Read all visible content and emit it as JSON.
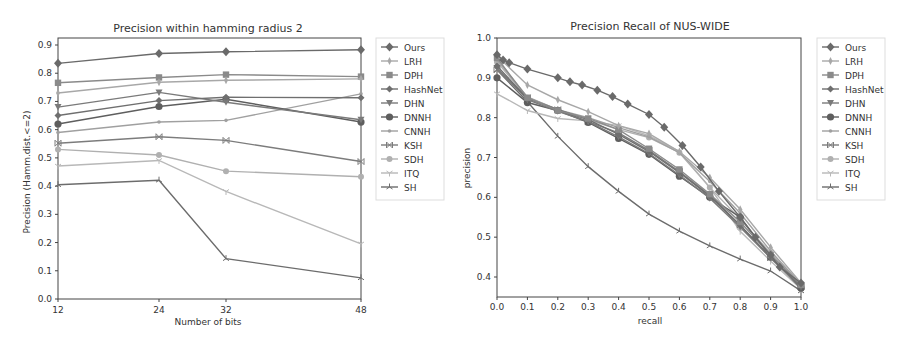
{
  "chart_data": [
    {
      "type": "line",
      "title": "Precision within hamming radius 2",
      "xlabel": "Number of bits",
      "ylabel": "Precision (Hamm.dist.<=2)",
      "x": [
        12,
        24,
        32,
        48
      ],
      "x_tick_labels": [
        "12",
        "24",
        "32",
        "48"
      ],
      "x_scale": "categorical-positions",
      "ylim": [
        0.0,
        0.92
      ],
      "y_ticks": [
        0.0,
        0.1,
        0.2,
        0.3,
        0.4,
        0.5,
        0.6,
        0.7,
        0.8,
        0.9
      ],
      "y_tick_labels": [
        "0.0",
        "0.1",
        "0.2",
        "0.3",
        "0.4",
        "0.5",
        "0.6",
        "0.7",
        "0.8",
        "0.9"
      ],
      "grid": false,
      "legend_position": "outside-right",
      "series": [
        {
          "name": "Ours",
          "marker": "diamond-big",
          "values": [
            0.835,
            0.87,
            0.876,
            0.883
          ]
        },
        {
          "name": "LRH",
          "marker": "thin-diamond",
          "values": [
            0.73,
            0.768,
            0.775,
            0.78
          ]
        },
        {
          "name": "DPH",
          "marker": "square",
          "values": [
            0.766,
            0.785,
            0.795,
            0.788
          ]
        },
        {
          "name": "HashNet",
          "marker": "plus-diamond",
          "values": [
            0.65,
            0.703,
            0.715,
            0.713
          ]
        },
        {
          "name": "DHN",
          "marker": "triangle-down",
          "values": [
            0.68,
            0.732,
            0.697,
            0.635
          ]
        },
        {
          "name": "DNNH",
          "marker": "circle",
          "values": [
            0.62,
            0.682,
            0.708,
            0.627
          ]
        },
        {
          "name": "CNNH",
          "marker": "star",
          "values": [
            0.59,
            0.627,
            0.633,
            0.727
          ]
        },
        {
          "name": "KSH",
          "marker": "x-bar",
          "values": [
            0.552,
            0.575,
            0.562,
            0.487
          ]
        },
        {
          "name": "SDH",
          "marker": "small-circle",
          "values": [
            0.53,
            0.51,
            0.453,
            0.433
          ]
        },
        {
          "name": "ITQ",
          "marker": "tri-down",
          "values": [
            0.471,
            0.491,
            0.381,
            0.195
          ]
        },
        {
          "name": "SH",
          "marker": "tri-up",
          "values": [
            0.405,
            0.421,
            0.143,
            0.075
          ]
        }
      ]
    },
    {
      "type": "line",
      "title": "Precision Recall of NUS-WIDE",
      "xlabel": "recall",
      "ylabel": "precision",
      "xlim": [
        0.0,
        1.0
      ],
      "ylim": [
        0.35,
        1.0
      ],
      "x_ticks": [
        0.0,
        0.1,
        0.2,
        0.3,
        0.4,
        0.5,
        0.6,
        0.7,
        0.8,
        0.9,
        1.0
      ],
      "x_tick_labels": [
        "0.0",
        "0.1",
        "0.2",
        "0.3",
        "0.4",
        "0.5",
        "0.6",
        "0.7",
        "0.8",
        "0.9",
        "1.0"
      ],
      "y_ticks": [
        0.4,
        0.5,
        0.6,
        0.7,
        0.8,
        0.9,
        1.0
      ],
      "y_tick_labels": [
        "0.4",
        "0.5",
        "0.6",
        "0.7",
        "0.8",
        "0.9",
        "1.0"
      ],
      "grid": false,
      "legend_position": "outside-right",
      "series": [
        {
          "name": "Ours",
          "marker": "diamond-big",
          "points": [
            [
              0.0,
              0.958
            ],
            [
              0.02,
              0.945
            ],
            [
              0.04,
              0.938
            ],
            [
              0.1,
              0.922
            ],
            [
              0.2,
              0.9
            ],
            [
              0.24,
              0.89
            ],
            [
              0.28,
              0.882
            ],
            [
              0.33,
              0.869
            ],
            [
              0.38,
              0.853
            ],
            [
              0.43,
              0.834
            ],
            [
              0.5,
              0.808
            ],
            [
              0.55,
              0.776
            ],
            [
              0.61,
              0.73
            ],
            [
              0.67,
              0.676
            ],
            [
              0.73,
              0.615
            ],
            [
              0.8,
              0.55
            ],
            [
              0.85,
              0.5
            ],
            [
              0.9,
              0.455
            ],
            [
              0.93,
              0.425
            ],
            [
              1.0,
              0.385
            ]
          ]
        },
        {
          "name": "LRH",
          "marker": "thin-diamond",
          "points": [
            [
              0.0,
              0.955
            ],
            [
              0.1,
              0.882
            ],
            [
              0.2,
              0.845
            ],
            [
              0.3,
              0.815
            ],
            [
              0.4,
              0.78
            ],
            [
              0.5,
              0.76
            ],
            [
              0.6,
              0.715
            ],
            [
              0.7,
              0.65
            ],
            [
              0.8,
              0.57
            ],
            [
              0.9,
              0.475
            ],
            [
              1.0,
              0.385
            ]
          ]
        },
        {
          "name": "DPH",
          "marker": "square",
          "points": [
            [
              0.0,
              0.95
            ],
            [
              0.1,
              0.85
            ],
            [
              0.2,
              0.818
            ],
            [
              0.3,
              0.798
            ],
            [
              0.4,
              0.77
            ],
            [
              0.5,
              0.722
            ],
            [
              0.6,
              0.67
            ],
            [
              0.7,
              0.608
            ],
            [
              0.8,
              0.538
            ],
            [
              0.9,
              0.455
            ],
            [
              1.0,
              0.38
            ]
          ]
        },
        {
          "name": "HashNet",
          "marker": "plus-diamond",
          "points": [
            [
              0.0,
              0.93
            ],
            [
              0.1,
              0.848
            ],
            [
              0.2,
              0.82
            ],
            [
              0.3,
              0.795
            ],
            [
              0.4,
              0.758
            ],
            [
              0.5,
              0.715
            ],
            [
              0.6,
              0.662
            ],
            [
              0.7,
              0.603
            ],
            [
              0.8,
              0.53
            ],
            [
              0.9,
              0.45
            ],
            [
              1.0,
              0.378
            ]
          ]
        },
        {
          "name": "DHN",
          "marker": "triangle-down",
          "points": [
            [
              0.0,
              0.925
            ],
            [
              0.1,
              0.845
            ],
            [
              0.2,
              0.816
            ],
            [
              0.3,
              0.79
            ],
            [
              0.4,
              0.752
            ],
            [
              0.5,
              0.71
            ],
            [
              0.6,
              0.656
            ],
            [
              0.7,
              0.598
            ],
            [
              0.8,
              0.525
            ],
            [
              0.9,
              0.448
            ],
            [
              1.0,
              0.375
            ]
          ]
        },
        {
          "name": "DNNH",
          "marker": "circle",
          "points": [
            [
              0.0,
              0.9
            ],
            [
              0.1,
              0.838
            ],
            [
              0.2,
              0.818
            ],
            [
              0.3,
              0.788
            ],
            [
              0.4,
              0.748
            ],
            [
              0.5,
              0.708
            ],
            [
              0.6,
              0.653
            ],
            [
              0.7,
              0.6
            ],
            [
              0.8,
              0.55
            ],
            [
              0.9,
              0.45
            ],
            [
              1.0,
              0.372
            ]
          ]
        },
        {
          "name": "CNNH",
          "marker": "star",
          "points": [
            [
              0.0,
              0.945
            ],
            [
              0.1,
              0.852
            ],
            [
              0.2,
              0.82
            ],
            [
              0.3,
              0.8
            ],
            [
              0.4,
              0.775
            ],
            [
              0.5,
              0.752
            ],
            [
              0.6,
              0.712
            ],
            [
              0.7,
              0.64
            ],
            [
              0.8,
              0.56
            ],
            [
              0.9,
              0.465
            ],
            [
              1.0,
              0.382
            ]
          ]
        },
        {
          "name": "KSH",
          "marker": "x-bar",
          "points": [
            [
              0.0,
              0.92
            ],
            [
              0.1,
              0.85
            ],
            [
              0.2,
              0.82
            ],
            [
              0.3,
              0.79
            ],
            [
              0.4,
              0.762
            ],
            [
              0.5,
              0.718
            ],
            [
              0.6,
              0.665
            ],
            [
              0.7,
              0.605
            ],
            [
              0.8,
              0.53
            ],
            [
              0.9,
              0.448
            ],
            [
              1.0,
              0.375
            ]
          ]
        },
        {
          "name": "SDH",
          "marker": "small-circle",
          "points": [
            [
              0.0,
              0.94
            ],
            [
              0.1,
              0.85
            ],
            [
              0.2,
              0.82
            ],
            [
              0.3,
              0.795
            ],
            [
              0.4,
              0.77
            ],
            [
              0.5,
              0.75
            ],
            [
              0.6,
              0.712
            ],
            [
              0.7,
              0.625
            ],
            [
              0.8,
              0.545
            ],
            [
              0.9,
              0.46
            ],
            [
              1.0,
              0.38
            ]
          ]
        },
        {
          "name": "ITQ",
          "marker": "tri-down",
          "points": [
            [
              0.0,
              0.86
            ],
            [
              0.1,
              0.818
            ],
            [
              0.2,
              0.798
            ],
            [
              0.3,
              0.792
            ],
            [
              0.4,
              0.78
            ],
            [
              0.5,
              0.755
            ],
            [
              0.6,
              0.715
            ],
            [
              0.7,
              0.625
            ],
            [
              0.8,
              0.515
            ],
            [
              0.9,
              0.44
            ],
            [
              1.0,
              0.37
            ]
          ]
        },
        {
          "name": "SH",
          "marker": "tri-up",
          "points": [
            [
              0.0,
              0.92
            ],
            [
              0.1,
              0.84
            ],
            [
              0.2,
              0.753
            ],
            [
              0.3,
              0.677
            ],
            [
              0.4,
              0.615
            ],
            [
              0.5,
              0.558
            ],
            [
              0.6,
              0.515
            ],
            [
              0.7,
              0.478
            ],
            [
              0.8,
              0.445
            ],
            [
              0.9,
              0.415
            ],
            [
              1.0,
              0.365
            ]
          ]
        }
      ]
    }
  ],
  "styles": {
    "Ours": "#6a6a6a",
    "LRH": "#a8a8a8",
    "DPH": "#8a8a8a",
    "HashNet": "#6f6f6f",
    "DHN": "#7a7a7a",
    "DNNH": "#5e5e5e",
    "CNNH": "#a0a0a0",
    "KSH": "#7c7c7c",
    "SDH": "#b0b0b0",
    "ITQ": "#b8b8b8",
    "SH": "#6c6c6c"
  }
}
